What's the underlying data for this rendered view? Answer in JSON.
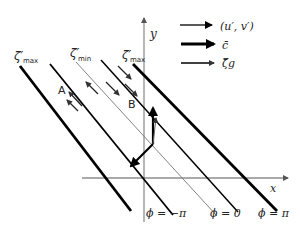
{
  "axes": {
    "x_label": "x",
    "y_label": "y"
  },
  "legend": {
    "items": [
      {
        "label": "(u′, v′)",
        "style": "thin"
      },
      {
        "label": "c̄",
        "style": "thick"
      },
      {
        "label": "ζ̄g",
        "style": "open"
      }
    ]
  },
  "contours": {
    "labels": [
      {
        "symbol": "ζ′",
        "sub": "max"
      },
      {
        "symbol": "ζ′",
        "sub": "min"
      },
      {
        "symbol": "ζ′",
        "sub": "max"
      }
    ]
  },
  "points": {
    "a": "A",
    "b": "B"
  },
  "phase_labels": [
    "ϕ = −π",
    "ϕ = 0",
    "ϕ = π"
  ],
  "colors": {
    "line": "#000000",
    "axis": "#888888",
    "thin_line": "#777777"
  }
}
